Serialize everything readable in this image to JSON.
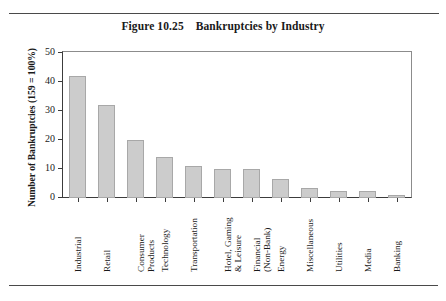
{
  "document": {
    "figure_title_prefix": "Figure 10.25",
    "figure_title_text": "Bankruptcies by Industry",
    "figure_title_full": "Figure 10.25    Bankruptcies by Industry"
  },
  "chart_data": {
    "type": "bar",
    "title": "Figure 10.25    Bankruptcies by Industry",
    "xlabel": "",
    "ylabel": "Number of Bankruptcies (159 = 100%)",
    "ylim": [
      0,
      50
    ],
    "yticks": [
      0,
      10,
      20,
      30,
      40,
      50
    ],
    "ytick_labels": [
      "0",
      "10",
      "20",
      "30",
      "40",
      "50"
    ],
    "grid": false,
    "legend": false,
    "bar_color": "#cccccc",
    "bar_edge_color": "#a8a8a8",
    "axis_color": "#3c3c3c",
    "categories": [
      "Industrial",
      "Retail",
      "Consumer\nProducts",
      "Technology",
      "Transportation",
      "Hotel, Gaming\n& Leisure",
      "Financial\n(Non-Bank)",
      "Energy",
      "Miscellaneous",
      "Utilities",
      "Media",
      "Banking"
    ],
    "values": [
      42,
      32,
      20,
      14,
      11,
      10,
      10,
      6.5,
      3.5,
      2.5,
      2.5,
      1
    ]
  }
}
